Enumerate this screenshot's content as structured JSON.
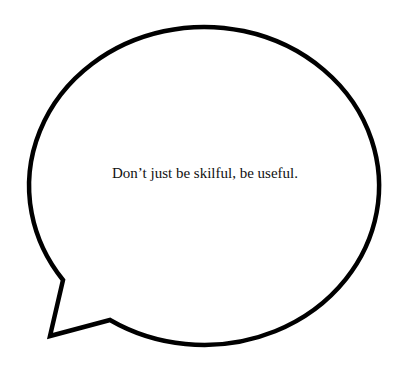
{
  "speech_bubble": {
    "text": "Don’t just be skilful, be useful.",
    "stroke_color": "#000000",
    "fill_color": "#ffffff"
  }
}
